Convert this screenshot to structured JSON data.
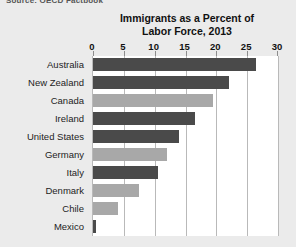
{
  "figure": {
    "cropped_caption_fragment": "Source: OECD Factbook",
    "background_color": "#ebebeb",
    "plot_background_color": "#ffffff",
    "gridline_color": "#b9b9b9"
  },
  "chart_data": {
    "type": "bar",
    "orientation": "horizontal",
    "title": "Immigrants as a Percent of Labor Force, 2013",
    "title_line1": "Immigrants as a Percent of",
    "title_line2": "Labor Force, 2013",
    "xlabel": "",
    "ylabel": "",
    "xlim": [
      0,
      30
    ],
    "xticks": [
      0,
      5,
      10,
      15,
      20,
      25,
      30
    ],
    "xtick_labels": [
      "0",
      "5",
      "10",
      "15",
      "20",
      "25",
      "30"
    ],
    "grid": true,
    "legend": "none",
    "categories": [
      "Australia",
      "New Zealand",
      "Canada",
      "Ireland",
      "United States",
      "Germany",
      "Italy",
      "Denmark",
      "Chile",
      "Mexico"
    ],
    "values": [
      26.5,
      22.0,
      19.5,
      16.5,
      14.0,
      12.0,
      10.5,
      7.5,
      4.0,
      0.5
    ],
    "bar_colors": [
      "#4a4a4a",
      "#4a4a4a",
      "#a8a8a8",
      "#4a4a4a",
      "#4a4a4a",
      "#a8a8a8",
      "#4a4a4a",
      "#a8a8a8",
      "#a8a8a8",
      "#4a4a4a"
    ],
    "color_dark": "#4a4a4a",
    "color_light": "#a8a8a8"
  }
}
